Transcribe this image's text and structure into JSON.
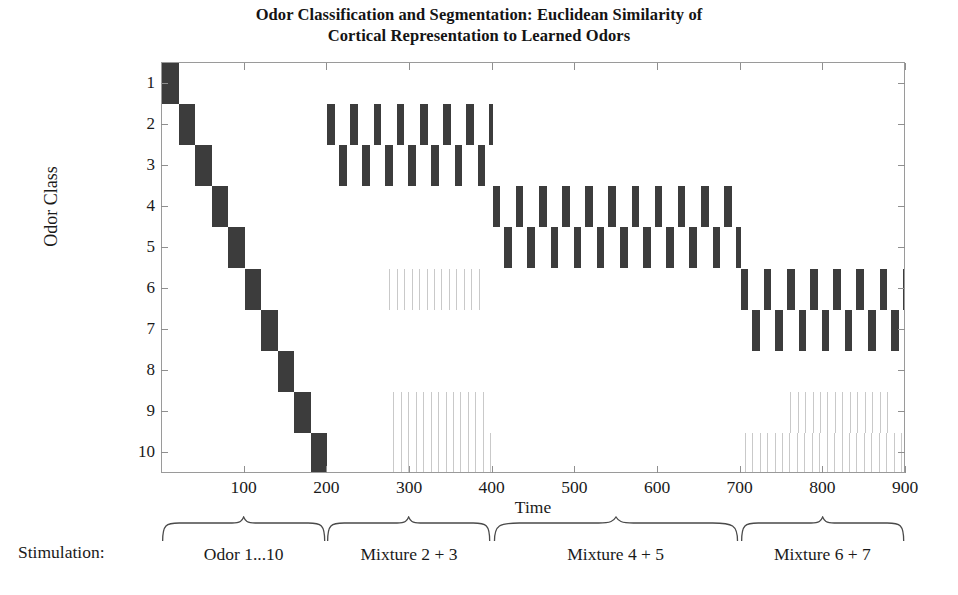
{
  "title": {
    "line1": "Odor Classification and Segmentation: Euclidean Similarity of",
    "line2": "Cortical Representation to Learned Odors"
  },
  "axes": {
    "ylabel": "Odor Class",
    "xlabel": "Time",
    "yticks": [
      "1",
      "2",
      "3",
      "4",
      "5",
      "6",
      "7",
      "8",
      "9",
      "10"
    ],
    "xticks": [
      "100",
      "200",
      "300",
      "400",
      "500",
      "600",
      "700",
      "800",
      "900"
    ],
    "xlim": [
      0,
      900
    ],
    "ylim": [
      0.5,
      10.5
    ]
  },
  "stimulation": {
    "label": "Stimulation:",
    "segments": [
      {
        "caption": "Odor 1...10",
        "start": 0,
        "end": 200
      },
      {
        "caption": "Mixture 2 + 3",
        "start": 200,
        "end": 400
      },
      {
        "caption": "Mixture 4 + 5",
        "start": 400,
        "end": 700
      },
      {
        "caption": "Mixture 6 + 7",
        "start": 700,
        "end": 900
      }
    ]
  },
  "colors": {
    "bar": "#3c3c3c",
    "faint": "#c9c9c9",
    "axis": "#9a9a9a",
    "text": "#1a1a1a",
    "background": "#ffffff"
  },
  "chart_data": {
    "type": "heatmap",
    "title": "Odor Classification and Segmentation: Euclidean Similarity of Cortical Representation to Learned Odors",
    "xlabel": "Time",
    "ylabel": "Odor Class",
    "xlim": [
      0,
      900
    ],
    "ylim": [
      0.5,
      10.5
    ],
    "grid": false,
    "legend": "none",
    "categories": [
      "1",
      "2",
      "3",
      "4",
      "5",
      "6",
      "7",
      "8",
      "9",
      "10"
    ],
    "phases": [
      {
        "name": "Odor 1...10",
        "start": 0,
        "end": 200,
        "pattern": "staircase",
        "note": "Each of the 10 learned odors presented in sequence for 20 time units; the matching class is active as one continuous block.",
        "blocks": [
          {
            "class": 1,
            "start": 0,
            "end": 20
          },
          {
            "class": 2,
            "start": 20,
            "end": 40
          },
          {
            "class": 3,
            "start": 40,
            "end": 60
          },
          {
            "class": 4,
            "start": 60,
            "end": 80
          },
          {
            "class": 5,
            "start": 80,
            "end": 100
          },
          {
            "class": 6,
            "start": 100,
            "end": 120
          },
          {
            "class": 7,
            "start": 120,
            "end": 140
          },
          {
            "class": 8,
            "start": 140,
            "end": 160
          },
          {
            "class": 9,
            "start": 160,
            "end": 180
          },
          {
            "class": 10,
            "start": 180,
            "end": 200
          }
        ]
      },
      {
        "name": "Mixture 2 + 3",
        "start": 200,
        "end": 400,
        "pattern": "alternating",
        "classes": [
          2,
          3
        ],
        "period": 14,
        "duty": 0.66,
        "note": "Cortical state oscillates between the two component odors of the mixture; classes 2 and 3 alternate in antiphase."
      },
      {
        "name": "Mixture 4 + 5",
        "start": 400,
        "end": 700,
        "pattern": "alternating",
        "classes": [
          4,
          5
        ],
        "period": 14,
        "duty": 0.66,
        "note": "Cortical state oscillates between classes 4 and 5 in antiphase."
      },
      {
        "name": "Mixture 6 + 7",
        "start": 700,
        "end": 900,
        "pattern": "alternating",
        "classes": [
          6,
          7
        ],
        "period": 14,
        "duty": 0.66,
        "note": "Cortical state oscillates between classes 6 and 7 in antiphase."
      }
    ],
    "weak_activity": [
      {
        "class": 6,
        "start": 275,
        "end": 390,
        "intensity": "faint"
      },
      {
        "class": 9,
        "start": 280,
        "end": 395,
        "intensity": "faint"
      },
      {
        "class": 10,
        "start": 280,
        "end": 400,
        "intensity": "faint"
      },
      {
        "class": 10,
        "start": 705,
        "end": 900,
        "intensity": "faint"
      },
      {
        "class": 9,
        "start": 760,
        "end": 880,
        "intensity": "faint"
      }
    ]
  }
}
